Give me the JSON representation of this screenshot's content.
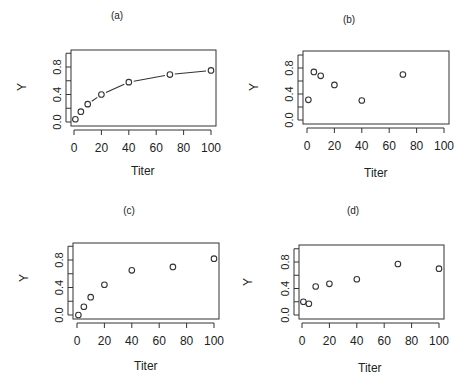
{
  "chart_data": [
    {
      "type": "line",
      "title": "(a)",
      "xlabel": "Titer",
      "ylabel": "Y",
      "x": [
        1,
        5,
        10,
        20,
        40,
        70,
        100
      ],
      "values": [
        0.04,
        0.15,
        0.26,
        0.4,
        0.58,
        0.69,
        0.75
      ],
      "markers": "open-circle",
      "connect": "dashed-segments",
      "xlim": [
        0,
        100
      ],
      "ylim": [
        0.0,
        0.9
      ],
      "xticks": [
        "0",
        "20",
        "40",
        "60",
        "80",
        "100"
      ],
      "yticks": [
        "0.0",
        "0.4",
        "0.8"
      ],
      "grid": false
    },
    {
      "type": "scatter",
      "title": "(b)",
      "xlabel": "Titer",
      "ylabel": "Y",
      "x": [
        1,
        5,
        10,
        20,
        40,
        70
      ],
      "values": [
        0.31,
        0.74,
        0.68,
        0.54,
        0.3,
        0.7
      ],
      "markers": "open-circle",
      "xlim": [
        0,
        100
      ],
      "ylim": [
        0.0,
        0.9
      ],
      "xticks": [
        "0",
        "20",
        "40",
        "60",
        "80",
        "100"
      ],
      "yticks": [
        "0.0",
        "0.4",
        "0.8"
      ],
      "grid": false
    },
    {
      "type": "scatter",
      "title": "(c)",
      "xlabel": "Titer",
      "ylabel": "Y",
      "x": [
        1,
        5,
        10,
        20,
        40,
        70,
        100
      ],
      "values": [
        0.0,
        0.12,
        0.26,
        0.44,
        0.65,
        0.7,
        0.82
      ],
      "markers": "open-circle",
      "xlim": [
        0,
        100
      ],
      "ylim": [
        0.0,
        0.9
      ],
      "xticks": [
        "0",
        "20",
        "40",
        "60",
        "80",
        "100"
      ],
      "yticks": [
        "0.0",
        "0.4",
        "0.8"
      ],
      "grid": false
    },
    {
      "type": "scatter",
      "title": "(d)",
      "xlabel": "Titer",
      "ylabel": "Y",
      "x": [
        1,
        5,
        10,
        20,
        40,
        70,
        100
      ],
      "values": [
        0.2,
        0.17,
        0.43,
        0.47,
        0.54,
        0.77,
        0.7
      ],
      "markers": "open-circle",
      "xlim": [
        0,
        100
      ],
      "ylim": [
        0.0,
        0.9
      ],
      "xticks": [
        "0",
        "20",
        "40",
        "60",
        "80",
        "100"
      ],
      "yticks": [
        "0.0",
        "0.4",
        "0.8"
      ],
      "grid": false
    }
  ],
  "colors": {
    "axis": "#333333",
    "marker": "#333333",
    "text": "#222222"
  }
}
